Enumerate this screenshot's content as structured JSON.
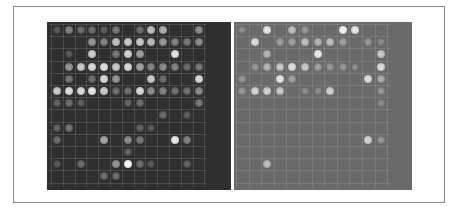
{
  "figure": {
    "panels": [
      {
        "id": "left",
        "description": "microarray scan, dark background",
        "background": "#2f2f2f",
        "grid": {
          "cols": 13,
          "rows": 13,
          "origin_x": 10,
          "origin_y": 8,
          "pitch_x": 11.8,
          "pitch_y": 12.2
        },
        "spots": [
          [
            0,
            0,
            90
          ],
          [
            1,
            0,
            130
          ],
          [
            2,
            0,
            110
          ],
          [
            3,
            0,
            110
          ],
          [
            4,
            0,
            95
          ],
          [
            5,
            0,
            120
          ],
          [
            7,
            0,
            110
          ],
          [
            8,
            0,
            190
          ],
          [
            9,
            0,
            175
          ],
          [
            12,
            0,
            140
          ],
          [
            3,
            1,
            150
          ],
          [
            4,
            1,
            130
          ],
          [
            5,
            1,
            190
          ],
          [
            6,
            1,
            200
          ],
          [
            7,
            1,
            200
          ],
          [
            8,
            1,
            185
          ],
          [
            9,
            1,
            150
          ],
          [
            10,
            1,
            130
          ],
          [
            11,
            1,
            120
          ],
          [
            12,
            1,
            140
          ],
          [
            1,
            2,
            90
          ],
          [
            3,
            2,
            205
          ],
          [
            5,
            2,
            120
          ],
          [
            6,
            2,
            210
          ],
          [
            7,
            2,
            160
          ],
          [
            10,
            2,
            225
          ],
          [
            1,
            3,
            150
          ],
          [
            2,
            3,
            200
          ],
          [
            3,
            3,
            215
          ],
          [
            4,
            3,
            220
          ],
          [
            5,
            3,
            200
          ],
          [
            6,
            3,
            215
          ],
          [
            7,
            3,
            160
          ],
          [
            8,
            3,
            130
          ],
          [
            9,
            3,
            140
          ],
          [
            10,
            3,
            130
          ],
          [
            11,
            3,
            110
          ],
          [
            12,
            3,
            120
          ],
          [
            1,
            4,
            120
          ],
          [
            3,
            4,
            110
          ],
          [
            4,
            4,
            215
          ],
          [
            5,
            4,
            150
          ],
          [
            8,
            4,
            200
          ],
          [
            9,
            4,
            110
          ],
          [
            12,
            4,
            215
          ],
          [
            0,
            5,
            200
          ],
          [
            1,
            5,
            220
          ],
          [
            2,
            5,
            215
          ],
          [
            3,
            5,
            230
          ],
          [
            4,
            5,
            200
          ],
          [
            5,
            5,
            110
          ],
          [
            6,
            5,
            110
          ],
          [
            7,
            5,
            215
          ],
          [
            8,
            5,
            140
          ],
          [
            9,
            5,
            130
          ],
          [
            10,
            5,
            115
          ],
          [
            11,
            5,
            115
          ],
          [
            12,
            5,
            140
          ],
          [
            0,
            6,
            100
          ],
          [
            1,
            6,
            110
          ],
          [
            2,
            6,
            95
          ],
          [
            6,
            6,
            100
          ],
          [
            7,
            6,
            110
          ],
          [
            12,
            6,
            120
          ],
          [
            9,
            7,
            110
          ],
          [
            11,
            7,
            95
          ],
          [
            0,
            8,
            100
          ],
          [
            1,
            8,
            115
          ],
          [
            7,
            8,
            100
          ],
          [
            8,
            8,
            90
          ],
          [
            0,
            9,
            110
          ],
          [
            4,
            9,
            165
          ],
          [
            6,
            9,
            140
          ],
          [
            7,
            9,
            120
          ],
          [
            10,
            9,
            230
          ],
          [
            11,
            9,
            130
          ],
          [
            6,
            10,
            100
          ],
          [
            0,
            11,
            90
          ],
          [
            2,
            11,
            110
          ],
          [
            5,
            11,
            150
          ],
          [
            6,
            11,
            250
          ],
          [
            7,
            11,
            110
          ],
          [
            8,
            11,
            90
          ],
          [
            11,
            11,
            100
          ],
          [
            4,
            12,
            110
          ],
          [
            5,
            12,
            110
          ]
        ]
      },
      {
        "id": "right",
        "description": "microarray scan, gray background",
        "background": "#6a6a6a",
        "grid": {
          "cols": 12,
          "rows": 13,
          "origin_x": 8,
          "origin_y": 8,
          "pitch_x": 12.6,
          "pitch_y": 12.2
        },
        "spots": [
          [
            0,
            0,
            140
          ],
          [
            2,
            0,
            230
          ],
          [
            4,
            0,
            190
          ],
          [
            5,
            0,
            150
          ],
          [
            8,
            0,
            240
          ],
          [
            9,
            0,
            230
          ],
          [
            1,
            1,
            220
          ],
          [
            3,
            1,
            160
          ],
          [
            4,
            1,
            160
          ],
          [
            5,
            1,
            190
          ],
          [
            6,
            1,
            180
          ],
          [
            7,
            1,
            190
          ],
          [
            8,
            1,
            160
          ],
          [
            10,
            1,
            150
          ],
          [
            11,
            1,
            140
          ],
          [
            2,
            2,
            180
          ],
          [
            6,
            2,
            235
          ],
          [
            11,
            2,
            200
          ],
          [
            1,
            3,
            150
          ],
          [
            2,
            3,
            180
          ],
          [
            3,
            3,
            200
          ],
          [
            4,
            3,
            220
          ],
          [
            5,
            3,
            200
          ],
          [
            6,
            3,
            160
          ],
          [
            7,
            3,
            150
          ],
          [
            8,
            3,
            150
          ],
          [
            9,
            3,
            140
          ],
          [
            11,
            3,
            220
          ],
          [
            0,
            4,
            150
          ],
          [
            3,
            4,
            230
          ],
          [
            4,
            4,
            160
          ],
          [
            10,
            4,
            220
          ],
          [
            11,
            4,
            170
          ],
          [
            0,
            5,
            150
          ],
          [
            1,
            5,
            210
          ],
          [
            2,
            5,
            210
          ],
          [
            3,
            5,
            200
          ],
          [
            5,
            5,
            140
          ],
          [
            6,
            5,
            140
          ],
          [
            7,
            5,
            210
          ],
          [
            11,
            5,
            150
          ],
          [
            11,
            6,
            140
          ],
          [
            10,
            9,
            210
          ],
          [
            11,
            9,
            150
          ],
          [
            2,
            11,
            190
          ]
        ]
      }
    ]
  }
}
